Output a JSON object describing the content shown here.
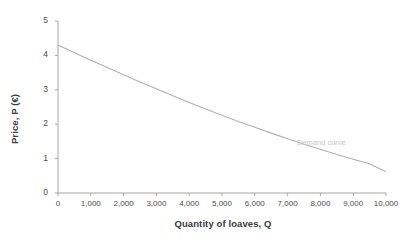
{
  "chart_data": {
    "type": "line",
    "title": "",
    "subtitle": "",
    "xlabel": "Quantity of loaves, Q",
    "ylabel": "Price, P (€)",
    "xlim": [
      0,
      10000
    ],
    "ylim": [
      0,
      5
    ],
    "grid": false,
    "legend_position": "inline-annotation",
    "x_ticks": [
      "0",
      "1,000",
      "2,000",
      "3,000",
      "4,000",
      "5,000",
      "6,000",
      "7,000",
      "8,000",
      "9,000",
      "10,000"
    ],
    "x_tick_values": [
      0,
      1000,
      2000,
      3000,
      4000,
      5000,
      6000,
      7000,
      8000,
      9000,
      10000
    ],
    "y_ticks": [
      "0",
      "1",
      "2",
      "3",
      "4",
      "5"
    ],
    "y_tick_values": [
      0,
      1,
      2,
      3,
      4,
      5
    ],
    "series": [
      {
        "name": "Demand curve",
        "color": "#b0b0b0",
        "annotation": "Demand curve",
        "annotation_x": 8200,
        "annotation_y": 1.45,
        "x": [
          0,
          500,
          1000,
          1500,
          2000,
          2500,
          3000,
          3500,
          4000,
          4500,
          5000,
          5500,
          6000,
          6500,
          7000,
          7500,
          8000,
          8500,
          9000,
          9500,
          10000
        ],
        "y": [
          4.3,
          4.08,
          3.86,
          3.65,
          3.44,
          3.23,
          3.03,
          2.83,
          2.63,
          2.44,
          2.26,
          2.08,
          1.91,
          1.74,
          1.58,
          1.42,
          1.27,
          1.12,
          0.98,
          0.85,
          0.62
        ]
      }
    ]
  },
  "colors": {
    "axis": "#a6a6a6",
    "curve": "#b0b0b0",
    "tick_text": "#4a4a4a",
    "title_text": "#3a3a3a",
    "annotation_text": "#c8c8c8",
    "background": "#ffffff"
  }
}
